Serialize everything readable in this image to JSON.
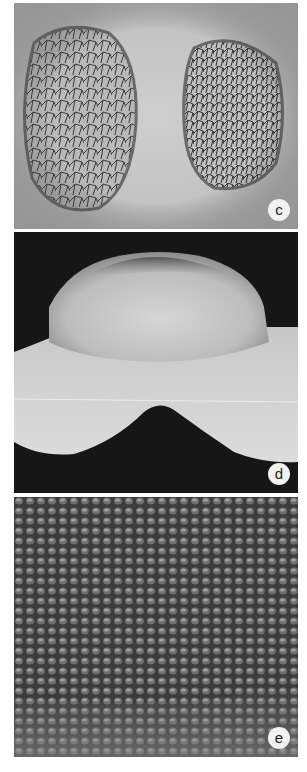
{
  "figure": {
    "panels": [
      {
        "id": "c",
        "label": "c",
        "description": "Light micrograph of two reticulate-textured lobes (pollen-like) on grey background"
      },
      {
        "id": "d",
        "label": "d",
        "description": "SEM of dome-shaped structure with two lower lobes on black background"
      },
      {
        "id": "e",
        "label": "e",
        "description": "SEM close-up of densely papillate/cobbled surface"
      }
    ],
    "colors": {
      "panel_c_bg": "#c4c4c4",
      "panel_d_bg": "#161616",
      "panel_e_bg": "#4a4a4a",
      "label_circle": "#f2f2f2"
    }
  }
}
